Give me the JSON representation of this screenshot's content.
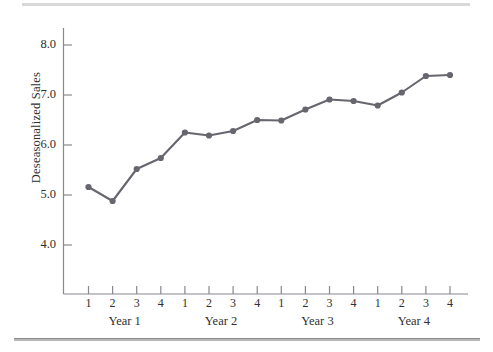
{
  "figure": {
    "background_color": "#ffffff",
    "top_rule_color": "#d9d9d9",
    "bottom_rule_color": "#8a8a8a"
  },
  "chart_data": {
    "type": "line",
    "title": "",
    "subtitle": "",
    "xlabel": "",
    "ylabel": "Deseasonalized Sales",
    "series_color": "#66666e",
    "marker": "circle",
    "grid": false,
    "legend": false,
    "legend_position": "none",
    "ylim": [
      3.5,
      8.5
    ],
    "yticks": [
      4.0,
      5.0,
      6.0,
      7.0,
      8.0
    ],
    "ytick_labels": [
      "4.0",
      "5.0",
      "6.0",
      "7.0",
      "8.0"
    ],
    "x": [
      1,
      2,
      3,
      4,
      5,
      6,
      7,
      8,
      9,
      10,
      11,
      12,
      13,
      14,
      15,
      16
    ],
    "categories": [
      "1",
      "2",
      "3",
      "4",
      "1",
      "2",
      "3",
      "4",
      "1",
      "2",
      "3",
      "4",
      "1",
      "2",
      "3",
      "4"
    ],
    "group_labels": [
      "Year 1",
      "Year 2",
      "Year 3",
      "Year 4"
    ],
    "values": [
      5.16,
      4.88,
      5.52,
      5.74,
      6.25,
      6.19,
      6.28,
      6.5,
      6.49,
      6.71,
      6.91,
      6.88,
      6.79,
      7.05,
      7.38,
      7.4
    ],
    "series": [
      {
        "name": "Deseasonalized Sales",
        "values": [
          5.16,
          4.88,
          5.52,
          5.74,
          6.25,
          6.19,
          6.28,
          6.5,
          6.49,
          6.71,
          6.91,
          6.88,
          6.79,
          7.05,
          7.38,
          7.4
        ]
      }
    ]
  },
  "axis": {
    "y_label_text": "Deseasonalized Sales",
    "ticks_y": [
      "8.0",
      "7.0",
      "6.0",
      "5.0",
      "4.0"
    ],
    "ticks_x": [
      "1",
      "2",
      "3",
      "4",
      "1",
      "2",
      "3",
      "4",
      "1",
      "2",
      "3",
      "4",
      "1",
      "2",
      "3",
      "4"
    ],
    "groups": [
      "Year 1",
      "Year 2",
      "Year 3",
      "Year 4"
    ]
  }
}
